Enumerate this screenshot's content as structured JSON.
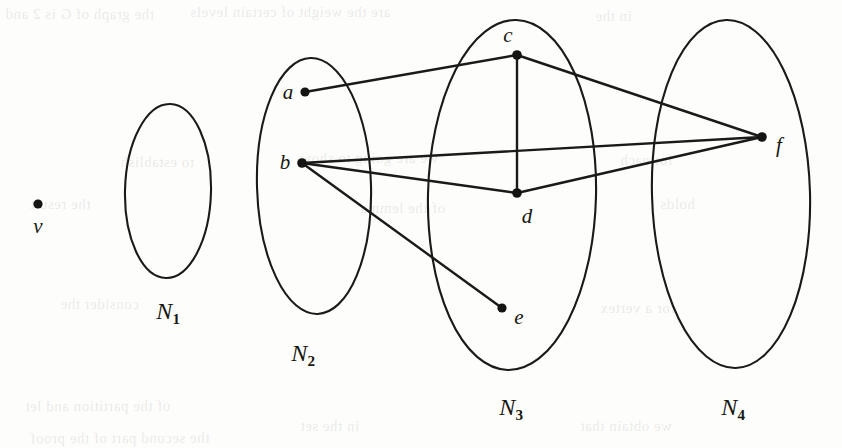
{
  "figure": {
    "background_color": "#fdfdfc",
    "ink_color": "#1a1a18",
    "width": 842,
    "height": 448
  },
  "sets": [
    {
      "id": "N1",
      "label": "N",
      "subscript": "1",
      "cx": 168,
      "cy": 191,
      "rx": 43,
      "ry": 87,
      "label_x": 168,
      "label_y": 311
    },
    {
      "id": "N2",
      "label": "N",
      "subscript": "2",
      "cx": 314,
      "cy": 186,
      "rx": 57,
      "ry": 128,
      "label_x": 303,
      "label_y": 353
    },
    {
      "id": "N3",
      "label": "N",
      "subscript": "3",
      "cx": 512,
      "cy": 195,
      "rx": 84,
      "ry": 175,
      "label_x": 511,
      "label_y": 407
    },
    {
      "id": "N4",
      "label": "N",
      "subscript": "4",
      "cx": 731,
      "cy": 194,
      "rx": 79,
      "ry": 174,
      "label_x": 733,
      "label_y": 407
    }
  ],
  "vertices": [
    {
      "id": "v",
      "label": "v",
      "x": 38,
      "y": 204,
      "label_x": 38,
      "label_y": 226,
      "r": 4.6,
      "set": null
    },
    {
      "id": "a",
      "label": "a",
      "x": 305,
      "y": 92,
      "label_x": 288,
      "label_y": 92,
      "r": 4.6,
      "set": "N2"
    },
    {
      "id": "b",
      "label": "b",
      "x": 302,
      "y": 163,
      "label_x": 285,
      "label_y": 162,
      "r": 4.8,
      "set": "N2"
    },
    {
      "id": "c",
      "label": "c",
      "x": 517,
      "y": 55,
      "label_x": 508,
      "label_y": 35,
      "r": 4.8,
      "set": "N3"
    },
    {
      "id": "d",
      "label": "d",
      "x": 517,
      "y": 193,
      "label_x": 527,
      "label_y": 216,
      "r": 4.8,
      "set": "N3"
    },
    {
      "id": "e",
      "label": "e",
      "x": 502,
      "y": 308,
      "label_x": 519,
      "label_y": 317,
      "r": 4.6,
      "set": "N3"
    },
    {
      "id": "f",
      "label": "f",
      "x": 762,
      "y": 137,
      "label_x": 779,
      "label_y": 145,
      "r": 4.8,
      "set": "N4"
    }
  ],
  "edges": [
    {
      "from": "a",
      "to": "c"
    },
    {
      "from": "c",
      "to": "d"
    },
    {
      "from": "c",
      "to": "f"
    },
    {
      "from": "b",
      "to": "d"
    },
    {
      "from": "b",
      "to": "f"
    },
    {
      "from": "b",
      "to": "e"
    },
    {
      "from": "d",
      "to": "f"
    }
  ],
  "ghost_text": [
    {
      "text": "the graph of G is 2 and",
      "x": 5,
      "y": 6
    },
    {
      "text": "are the weight of certain levels",
      "x": 190,
      "y": 4
    },
    {
      "text": "in the",
      "x": 595,
      "y": 8
    },
    {
      "text": "to establish",
      "x": 120,
      "y": 154
    },
    {
      "text": "we are going to show",
      "x": 300,
      "y": 150
    },
    {
      "text": "for each",
      "x": 620,
      "y": 152
    },
    {
      "text": "the result",
      "x": 30,
      "y": 196
    },
    {
      "text": "of the lemma",
      "x": 360,
      "y": 200
    },
    {
      "text": "holds",
      "x": 660,
      "y": 196
    },
    {
      "text": "consider the",
      "x": 60,
      "y": 296
    },
    {
      "text": "for a vertex",
      "x": 600,
      "y": 300
    },
    {
      "text": "of the partition and let",
      "x": 25,
      "y": 398
    },
    {
      "text": "in the set",
      "x": 300,
      "y": 418
    },
    {
      "text": "we obtain that",
      "x": 580,
      "y": 418
    },
    {
      "text": "the second part of the proof",
      "x": 30,
      "y": 430
    }
  ]
}
